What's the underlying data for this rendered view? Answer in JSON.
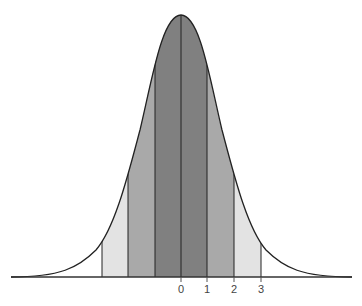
{
  "diagram": {
    "type": "normal-distribution-bell-curve",
    "axis_labels": [
      "0",
      "1",
      "2",
      "3"
    ],
    "bands": [
      {
        "range": "-3 to -2",
        "color": "#e3e3e3"
      },
      {
        "range": "-2 to -1",
        "color": "#a9a9a9"
      },
      {
        "range": "-1 to 0",
        "color": "#808080"
      },
      {
        "range": "0 to 1",
        "color": "#808080"
      },
      {
        "range": "1 to 2",
        "color": "#a9a9a9"
      },
      {
        "range": "2 to 3",
        "color": "#e3e3e3"
      }
    ],
    "outline_color": "#222222"
  }
}
